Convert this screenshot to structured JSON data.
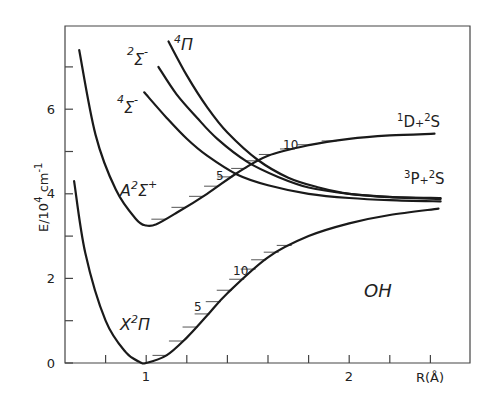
{
  "chart_data": {
    "type": "line",
    "title": "",
    "molecule_label": "OH",
    "xlabel": "R(Å)",
    "ylabel": "E/10⁴ cm⁻¹",
    "ylabel_parts": {
      "base": "E/10",
      "exp": "4",
      "unit": " cm",
      "unit_exp": "-1"
    },
    "xlim": [
      0.6,
      2.6
    ],
    "ylim": [
      0,
      8
    ],
    "x_ticks": [
      0.8,
      1.0,
      1.2,
      1.4,
      1.6,
      1.8,
      2.0,
      2.2,
      2.4
    ],
    "x_tick_labels": [
      {
        "value": 1,
        "label": "1"
      },
      {
        "value": 2,
        "label": "2"
      }
    ],
    "y_ticks": [
      0,
      1,
      2,
      3,
      4,
      5,
      6,
      7
    ],
    "y_tick_labels": [
      {
        "value": 0,
        "label": "0"
      },
      {
        "value": 2,
        "label": "2"
      },
      {
        "value": 4,
        "label": "4"
      },
      {
        "value": 6,
        "label": "6"
      }
    ],
    "grid": false,
    "series": [
      {
        "name": "X²Π",
        "label_main": "X",
        "label_sup": "2",
        "label_sym": "Π",
        "x": [
          0.645,
          0.7,
          0.8,
          0.9,
          0.97,
          1.0,
          1.1,
          1.2,
          1.3,
          1.4,
          1.6,
          1.8,
          2.0,
          2.2,
          2.44
        ],
        "y": [
          4.3,
          2.6,
          1.0,
          0.25,
          0.02,
          0.0,
          0.18,
          0.6,
          1.12,
          1.65,
          2.5,
          3.0,
          3.3,
          3.5,
          3.65
        ]
      },
      {
        "name": "A²Σ⁺",
        "label_main": "A",
        "label_sup": "2",
        "label_sym": "Σ",
        "label_sup2": "+",
        "x": [
          0.67,
          0.75,
          0.85,
          0.95,
          1.0,
          1.05,
          1.15,
          1.3,
          1.45,
          1.6,
          1.8,
          2.0,
          2.2,
          2.42
        ],
        "y": [
          7.4,
          5.4,
          4.1,
          3.4,
          3.25,
          3.28,
          3.55,
          4.0,
          4.5,
          4.9,
          5.15,
          5.3,
          5.38,
          5.42
        ]
      },
      {
        "name": "⁴Σ⁻",
        "label_sup": "4",
        "label_sym": "Σ",
        "label_sup2": "-",
        "x": [
          0.99,
          1.1,
          1.2,
          1.3,
          1.45,
          1.6,
          1.8,
          2.0,
          2.2,
          2.45
        ],
        "y": [
          6.4,
          5.8,
          5.3,
          4.9,
          4.45,
          4.2,
          4.0,
          3.9,
          3.85,
          3.82
        ]
      },
      {
        "name": "²Σ⁻",
        "label_sup": "2",
        "label_sym": "Σ",
        "label_sup2": "-",
        "x": [
          1.06,
          1.15,
          1.25,
          1.35,
          1.5,
          1.65,
          1.8,
          2.0,
          2.2,
          2.45
        ],
        "y": [
          7.0,
          6.35,
          5.8,
          5.3,
          4.75,
          4.4,
          4.15,
          4.0,
          3.92,
          3.88
        ]
      },
      {
        "name": "⁴Π",
        "label_sup": "4",
        "label_sym": "Π",
        "x": [
          1.11,
          1.2,
          1.3,
          1.4,
          1.55,
          1.7,
          1.85,
          2.0,
          2.2,
          2.45
        ],
        "y": [
          7.6,
          6.8,
          6.05,
          5.45,
          4.8,
          4.38,
          4.15,
          4.0,
          3.93,
          3.9
        ]
      }
    ],
    "dissociation_limits": [
      {
        "label": "¹D+²S",
        "parts": {
          "s1": "1",
          "a": "D",
          "plus": "+",
          "s2": "2",
          "b": "S"
        },
        "energy": 5.4
      },
      {
        "label": "³P+²S",
        "parts": {
          "s1": "3",
          "a": "P",
          "plus": "+",
          "s2": "2",
          "b": "S"
        },
        "energy": 3.85
      }
    ],
    "vibrational_level_annotations": [
      {
        "state": "X²Π",
        "v": 5,
        "label": "5"
      },
      {
        "state": "X²Π",
        "v": 10,
        "label": "10"
      },
      {
        "state": "A²Σ⁺",
        "v": 5,
        "label": "5"
      },
      {
        "state": "A²Σ⁺",
        "v": 10,
        "label": "10"
      }
    ],
    "legend": "none (curves labeled inline)"
  }
}
